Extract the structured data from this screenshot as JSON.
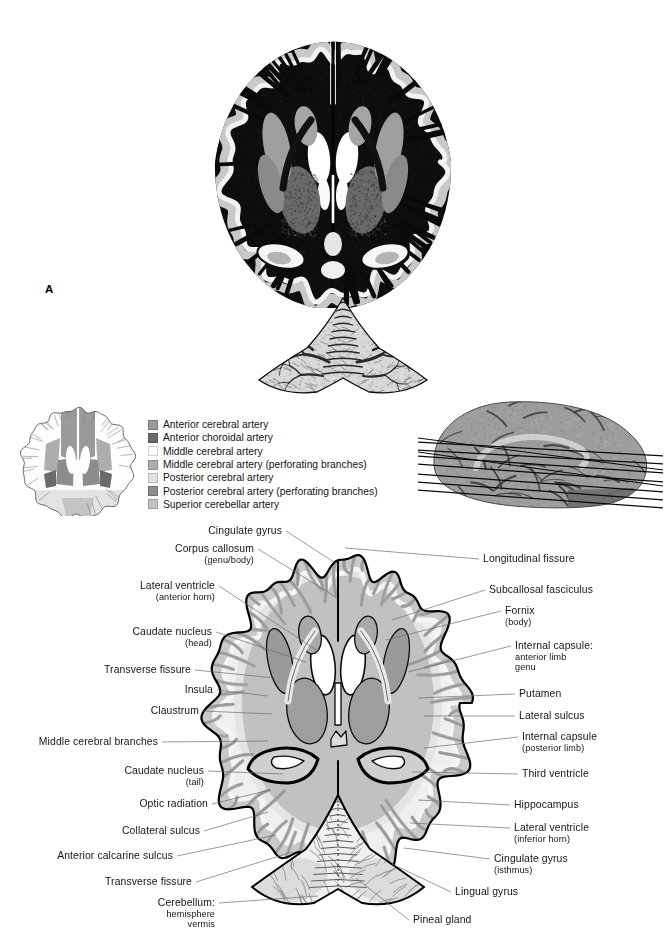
{
  "figure": {
    "panel_letter": "A",
    "type": "brain-axial-section-atlas"
  },
  "legend": {
    "title": "",
    "items": [
      {
        "label": "Anterior cerebral artery",
        "color": "#9a9a9a"
      },
      {
        "label": "Anterior choroidal artery",
        "color": "#6b6b6b"
      },
      {
        "label": "Middle cerebral artery",
        "color": "#fdfdfd"
      },
      {
        "label": "Middle cerebral artery (perforating branches)",
        "color": "#adadad"
      },
      {
        "label": "Posterior cerebral artery",
        "color": "#e3e3e3"
      },
      {
        "label": "Posterior cerebral artery (perforating branches)",
        "color": "#8c8c8c"
      },
      {
        "label": "Superior cerebellar artery",
        "color": "#c4c4c4"
      }
    ]
  },
  "labels_left": [
    {
      "id": "cingulate-gyrus",
      "text": "Cingulate gyrus",
      "sub": "",
      "x": 282,
      "y": 531,
      "tx": 340,
      "ty": 566
    },
    {
      "id": "corpus-callosum",
      "text": "Corpus callosum",
      "sub": "(genu/body)",
      "x": 254,
      "y": 549,
      "tx": 336,
      "ty": 597
    },
    {
      "id": "lateral-ventricle-ah",
      "text": "Lateral ventricle",
      "sub": "(anterior horn)",
      "x": 215,
      "y": 586,
      "tx": 318,
      "ty": 651
    },
    {
      "id": "caudate-nucleus-head",
      "text": "Caudate nucleus",
      "sub": "(head)",
      "x": 212,
      "y": 632,
      "tx": 306,
      "ty": 662
    },
    {
      "id": "transverse-fissure-1",
      "text": "Transverse fissure",
      "sub": "",
      "x": 191,
      "y": 670,
      "tx": 275,
      "ty": 678
    },
    {
      "id": "insula",
      "text": "Insula",
      "sub": "",
      "x": 213,
      "y": 690,
      "tx": 268,
      "ty": 696
    },
    {
      "id": "claustrum",
      "text": "Claustrum",
      "sub": "",
      "x": 199,
      "y": 711,
      "tx": 272,
      "ty": 714
    },
    {
      "id": "middle-cerebral-branch",
      "text": "Middle cerebral branches",
      "sub": "",
      "x": 158,
      "y": 742,
      "tx": 268,
      "ty": 741
    },
    {
      "id": "caudate-nucleus-tail",
      "text": "Caudate nucleus",
      "sub": "(tail)",
      "x": 204,
      "y": 771,
      "tx": 283,
      "ty": 774
    },
    {
      "id": "optic-radiation",
      "text": "Optic radiation",
      "sub": "",
      "x": 208,
      "y": 804,
      "tx": 270,
      "ty": 790
    },
    {
      "id": "collateral-sulcus",
      "text": "Collateral sulcus",
      "sub": "",
      "x": 200,
      "y": 831,
      "tx": 268,
      "ty": 812
    },
    {
      "id": "anterior-calcarine",
      "text": "Anterior calcarine sulcus",
      "sub": "",
      "x": 173,
      "y": 856,
      "tx": 276,
      "ty": 835
    },
    {
      "id": "transverse-fissure-2",
      "text": "Transverse fissure",
      "sub": "",
      "x": 192,
      "y": 882,
      "tx": 292,
      "ty": 852
    },
    {
      "id": "cerebellum",
      "text": "Cerebellum:",
      "sub": "hemisphere|vermis",
      "x": 215,
      "y": 903,
      "tx": 318,
      "ty": 896
    }
  ],
  "labels_right": [
    {
      "id": "longitudinal-fissure",
      "text": "Longitudinal fissure",
      "sub": "",
      "x": 483,
      "y": 559,
      "tx": 345,
      "ty": 548
    },
    {
      "id": "subcallosal-fasciculus",
      "text": "Subcallosal fasciculus",
      "sub": "",
      "x": 489,
      "y": 590,
      "tx": 392,
      "ty": 620
    },
    {
      "id": "fornix",
      "text": "Fornix",
      "sub": "(body)",
      "x": 505,
      "y": 611,
      "tx": 386,
      "ty": 640
    },
    {
      "id": "internal-capsule",
      "text": "Internal capsule:",
      "sub": "anterior limb|genu",
      "x": 515,
      "y": 646,
      "tx": 408,
      "ty": 672
    },
    {
      "id": "putamen",
      "text": "Putamen",
      "sub": "",
      "x": 519,
      "y": 694,
      "tx": 418,
      "ty": 698
    },
    {
      "id": "lateral-sulcus",
      "text": "Lateral sulcus",
      "sub": "",
      "x": 519,
      "y": 716,
      "tx": 424,
      "ty": 716
    },
    {
      "id": "internal-capsule-post",
      "text": "Internal capsule",
      "sub": "(posterior limb)",
      "x": 522,
      "y": 737,
      "tx": 424,
      "ty": 748
    },
    {
      "id": "third-ventricle",
      "text": "Third ventricle",
      "sub": "",
      "x": 522,
      "y": 774,
      "tx": 412,
      "ty": 772
    },
    {
      "id": "hippocampus",
      "text": "Hippocampus",
      "sub": "",
      "x": 514,
      "y": 805,
      "tx": 418,
      "ty": 800
    },
    {
      "id": "lateral-ventricle-ih",
      "text": "Lateral ventricle",
      "sub": "(inferior horn)",
      "x": 514,
      "y": 828,
      "tx": 410,
      "ty": 823
    },
    {
      "id": "cingulate-gyrus-isth",
      "text": "Cingulate gyrus",
      "sub": "(isthmus)",
      "x": 494,
      "y": 859,
      "tx": 404,
      "ty": 848
    },
    {
      "id": "lingual-gyrus",
      "text": "Lingual gyrus",
      "sub": "",
      "x": 455,
      "y": 892,
      "tx": 392,
      "ty": 864
    },
    {
      "id": "pineal-gland",
      "text": "Pineal gland",
      "sub": "",
      "x": 413,
      "y": 920,
      "tx": 356,
      "ty": 878
    }
  ],
  "colors": {
    "leader": "#6e6e6e",
    "text": "#141414",
    "outline": "#000000",
    "gray_matter": "#b9b9b9",
    "white_matter": "#e8e8e8",
    "background": "#ffffff"
  },
  "chart_data": {
    "type": "diagram",
    "panels": [
      {
        "name": "stained-section-photo",
        "description": "Myelin-stained axial brain section (photograph)"
      },
      {
        "name": "vascular-territory-key",
        "description": "Small axial outline shaded by arterial territory"
      },
      {
        "name": "sagittal-orientation",
        "description": "Mid-sagittal brain with section plane lines"
      },
      {
        "name": "labeled-line-drawing",
        "description": "Matching line drawing with structure labels"
      }
    ]
  }
}
